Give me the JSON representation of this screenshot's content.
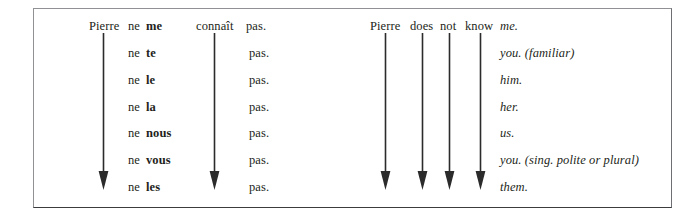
{
  "figure": {
    "kind": "grammar-placement-diagram",
    "border_color": "#8f9194",
    "text_color": "#231f20",
    "background": "#ffffff"
  },
  "french": {
    "subject": "Pierre",
    "negation_first": "ne",
    "verb": "connaît",
    "negation_second": "pas.",
    "pronouns": [
      "me",
      "te",
      "le",
      "la",
      "nous",
      "vous",
      "les"
    ],
    "ne_repeat": [
      "ne",
      "ne",
      "ne",
      "ne",
      "ne",
      "ne",
      "ne"
    ],
    "pas_repeat": [
      "pas.",
      "pas.",
      "pas.",
      "pas.",
      "pas.",
      "pas.",
      "pas."
    ]
  },
  "english": {
    "subject": "Pierre",
    "auxiliary": "does",
    "negation": "not",
    "verb": "know",
    "objects": [
      "me.",
      "you. (familiar)",
      "him.",
      "her.",
      "us.",
      "you. (sing. polite or plural)",
      "them."
    ]
  },
  "arrows": [
    {
      "name": "arrow-pierre-fr",
      "label": "Pierre"
    },
    {
      "name": "arrow-connait-fr",
      "label": "connaît"
    },
    {
      "name": "arrow-pierre-en",
      "label": "Pierre"
    },
    {
      "name": "arrow-does-en",
      "label": "does"
    },
    {
      "name": "arrow-not-en",
      "label": "not"
    },
    {
      "name": "arrow-know-en",
      "label": "know"
    }
  ]
}
